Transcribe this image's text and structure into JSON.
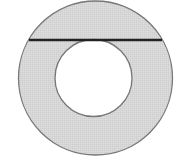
{
  "diagram": {
    "type": "annulus-with-tangent-chord",
    "outer_circle": {
      "cx": 95.5,
      "cy": 78,
      "r": 77
    },
    "inner_circle": {
      "cx": 93.5,
      "cy": 78,
      "r": 38.5
    },
    "chord": {
      "x1": 29,
      "y1": 40,
      "x2": 162,
      "y2": 40
    },
    "colors": {
      "ring_fill": "#d6d6d6",
      "outline": "#777777",
      "chord": "#222222",
      "inner_fill": "#ffffff",
      "background": "#ffffff"
    }
  }
}
